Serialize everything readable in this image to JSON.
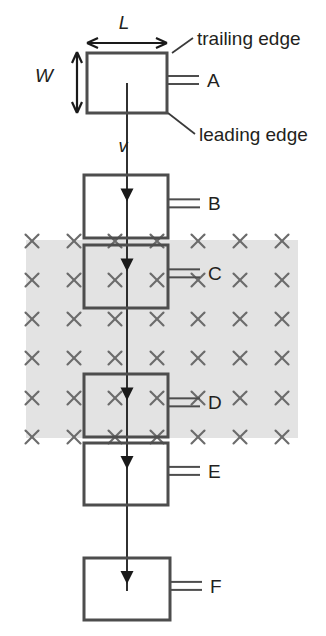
{
  "figure": {
    "background_color": "#ffffff",
    "width": 326,
    "height": 636
  },
  "field_region": {
    "name": "magnetic-field-region",
    "fill_color": "#e3e3e3",
    "symbol": "×",
    "symbol_meaning": "field-into-page",
    "symbol_color": "#6b6b6b",
    "x": 26,
    "y": 240,
    "width": 272,
    "height": 198,
    "columns": 7,
    "rows": 6,
    "column_x": [
      32,
      74,
      115,
      157,
      198,
      240,
      282
    ],
    "row_y": [
      241,
      280,
      319,
      358,
      398,
      437
    ]
  },
  "loops": [
    {
      "id": "A",
      "label": "A",
      "x": 87,
      "y": 53,
      "width": 80,
      "height": 60,
      "in_field": false
    },
    {
      "id": "B",
      "label": "B",
      "x": 84,
      "y": 175,
      "width": 84,
      "height": 63,
      "in_field": false
    },
    {
      "id": "C",
      "label": "C",
      "x": 84,
      "y": 245,
      "width": 84,
      "height": 63,
      "in_field": true
    },
    {
      "id": "D",
      "label": "D",
      "x": 84,
      "y": 374,
      "width": 84,
      "height": 63,
      "in_field": true
    },
    {
      "id": "E",
      "label": "E",
      "x": 84,
      "y": 443,
      "width": 84,
      "height": 62,
      "in_field": false
    },
    {
      "id": "F",
      "label": "F",
      "x": 84,
      "y": 558,
      "width": 86,
      "height": 62,
      "in_field": false
    }
  ],
  "loop_box_color": "#4d4d4d",
  "terminal_color": "#4d4d4d",
  "dimensions": {
    "length": {
      "symbol": "L",
      "label_x": 124,
      "label_y": 29,
      "arrow_y": 43,
      "x1": 87,
      "x2": 167
    },
    "width": {
      "symbol": "W",
      "label_x": 44,
      "label_y": 82,
      "arrow_x": 77,
      "y1": 52,
      "y2": 113
    }
  },
  "velocity": {
    "symbol": "v",
    "label_x": 123,
    "label_y": 152,
    "direction": "downward",
    "color": "#1a1a1a"
  },
  "annotations": [
    {
      "name": "trailing-edge",
      "text": "trailing edge",
      "text_x": 197,
      "text_y": 45,
      "leader": "M 193 38 L 172 53"
    },
    {
      "name": "leading-edge",
      "text": "leading edge",
      "text_x": 199,
      "text_y": 141,
      "leader": "M 195 134 L 168 113"
    }
  ],
  "text_color": "#231f20"
}
